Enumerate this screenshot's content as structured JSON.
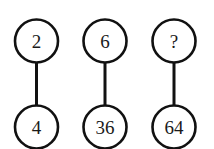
{
  "canvas": {
    "width": 214,
    "height": 149,
    "background": "#ffffff",
    "stroke_color": "#111111",
    "text_color": "#1a1a1a"
  },
  "diagram": {
    "type": "node-link-pairs",
    "title": "",
    "column_centers_x": [
      36.5,
      105,
      174
    ],
    "top_row_center_y": 41,
    "bottom_row_center_y": 127,
    "node_radius": 21.5,
    "pairs": [
      {
        "id": "pair-1",
        "top": {
          "label": "2",
          "is_unknown": false
        },
        "bottom": {
          "label": "4",
          "is_unknown": false
        }
      },
      {
        "id": "pair-2",
        "top": {
          "label": "6",
          "is_unknown": false
        },
        "bottom": {
          "label": "36",
          "is_unknown": false
        }
      },
      {
        "id": "pair-3",
        "top": {
          "label": "?",
          "is_unknown": true
        },
        "bottom": {
          "label": "64",
          "is_unknown": false
        }
      }
    ]
  }
}
